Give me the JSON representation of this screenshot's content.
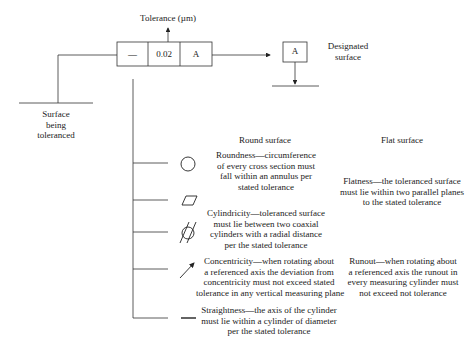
{
  "feature_control_frame": {
    "symbol": "—",
    "tolerance_value": "0.02",
    "datum": "A"
  },
  "labels": {
    "tolerance": "Tolerance (µm)",
    "designated_surface_line1": "Designated",
    "designated_surface_line2": "surface",
    "surface_toleranced_line1": "Surface",
    "surface_toleranced_line2": "being",
    "surface_toleranced_line3": "toleranced",
    "datum_box": "A",
    "round_surface": "Round surface",
    "flat_surface": "Flat surface"
  },
  "tolerances": [
    {
      "symbol": "circle-icon",
      "round_text": [
        "Roundness—circumference",
        "of every cross section must",
        "fall within an annulus per",
        "stated tolerance"
      ],
      "flat_text": []
    },
    {
      "symbol": "parallelogram-icon",
      "round_text": [],
      "flat_text": [
        "Flatness—the toleranced surface",
        "must lie within two parallel planes",
        "to the stated tolerance"
      ]
    },
    {
      "symbol": "cylindricity-icon",
      "round_text": [
        "Cylindricity—toleranced surface",
        "must lie between two coaxial",
        "cylinders with a radial distance",
        "per the stated tolerance"
      ],
      "flat_text": []
    },
    {
      "symbol": "arrow-icon",
      "round_text": [
        "Concentricity—when rotating about",
        "a referenced axis the deviation from",
        "concentricity must not exceed stated",
        "tolerance in any vertical measuring plane"
      ],
      "flat_text": [
        "Runout—when rotating about",
        "a referenced axis the runout in",
        "every measuring cylinder must",
        "not exceed not tolerance"
      ]
    },
    {
      "symbol": "straightness-icon",
      "round_text": [
        "Straightness—the axis of the cylinder",
        "must lie within a cylinder of diameter",
        "per the stated tolerance"
      ],
      "flat_text": []
    }
  ]
}
